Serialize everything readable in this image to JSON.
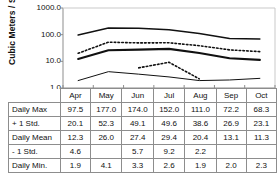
{
  "chart_data": {
    "type": "line",
    "title": "",
    "xlabel": "",
    "ylabel": "Cubic Meters / Second",
    "yscale": "log",
    "ylim": [
      1.0,
      1000.0
    ],
    "yticks": [
      "1000.0",
      "100.0",
      "10.0",
      "1.0"
    ],
    "ytick_values": [
      1000.0,
      100.0,
      10.0,
      1.0
    ],
    "grid": false,
    "legend": "none",
    "categories": [
      "Apr",
      "May",
      "Jun",
      "Jul",
      "Aug",
      "Sep",
      "Oct"
    ],
    "series": [
      {
        "name": "Daily Max",
        "style": "solid-medium",
        "values": [
          97.5,
          177.0,
          174.0,
          152.0,
          111.0,
          72.2,
          68.3
        ]
      },
      {
        "name": "+ 1 Std.",
        "style": "dotted",
        "values": [
          20.1,
          52.3,
          49.1,
          49.6,
          38.6,
          26.9,
          23.1
        ]
      },
      {
        "name": "Daily Mean",
        "style": "solid-thick",
        "values": [
          12.3,
          26.0,
          27.4,
          29.4,
          20.4,
          13.1,
          11.3
        ]
      },
      {
        "name": "- 1 Std.",
        "style": "dotted",
        "values": [
          4.6,
          null,
          5.7,
          9.2,
          2.2,
          null,
          null
        ]
      },
      {
        "name": "Daily Min.",
        "style": "solid-thin",
        "values": [
          1.9,
          4.1,
          3.3,
          2.6,
          1.9,
          2.0,
          2.3
        ]
      }
    ]
  },
  "axis": {
    "title": "Cubic Meters / Second",
    "ticks": [
      "1000.0",
      "100.0",
      "10.0",
      "1.0"
    ]
  },
  "table": {
    "months": [
      "Apr",
      "May",
      "Jun",
      "Jul",
      "Aug",
      "Sep",
      "Oct"
    ],
    "rows": [
      {
        "label": "Daily Max",
        "cells": [
          "97.5",
          "177.0",
          "174.0",
          "152.0",
          "111.0",
          "72.2",
          "68.3"
        ]
      },
      {
        "label": "+ 1 Std.",
        "cells": [
          "20.1",
          "52.3",
          "49.1",
          "49.6",
          "38.6",
          "26.9",
          "23.1"
        ]
      },
      {
        "label": "Daily Mean",
        "cells": [
          "12.3",
          "26.0",
          "27.4",
          "29.4",
          "20.4",
          "13.1",
          "11.3"
        ]
      },
      {
        "label": "- 1 Std.",
        "cells": [
          "4.6",
          "",
          "5.7",
          "9.2",
          "2.2",
          "",
          ""
        ]
      },
      {
        "label": "Daily Min.",
        "cells": [
          "1.9",
          "4.1",
          "3.3",
          "2.6",
          "1.9",
          "2.0",
          "2.3"
        ]
      }
    ]
  },
  "colors": {
    "ink": "#111111",
    "rule": "#8d8d8d",
    "background": "#ffffff"
  }
}
